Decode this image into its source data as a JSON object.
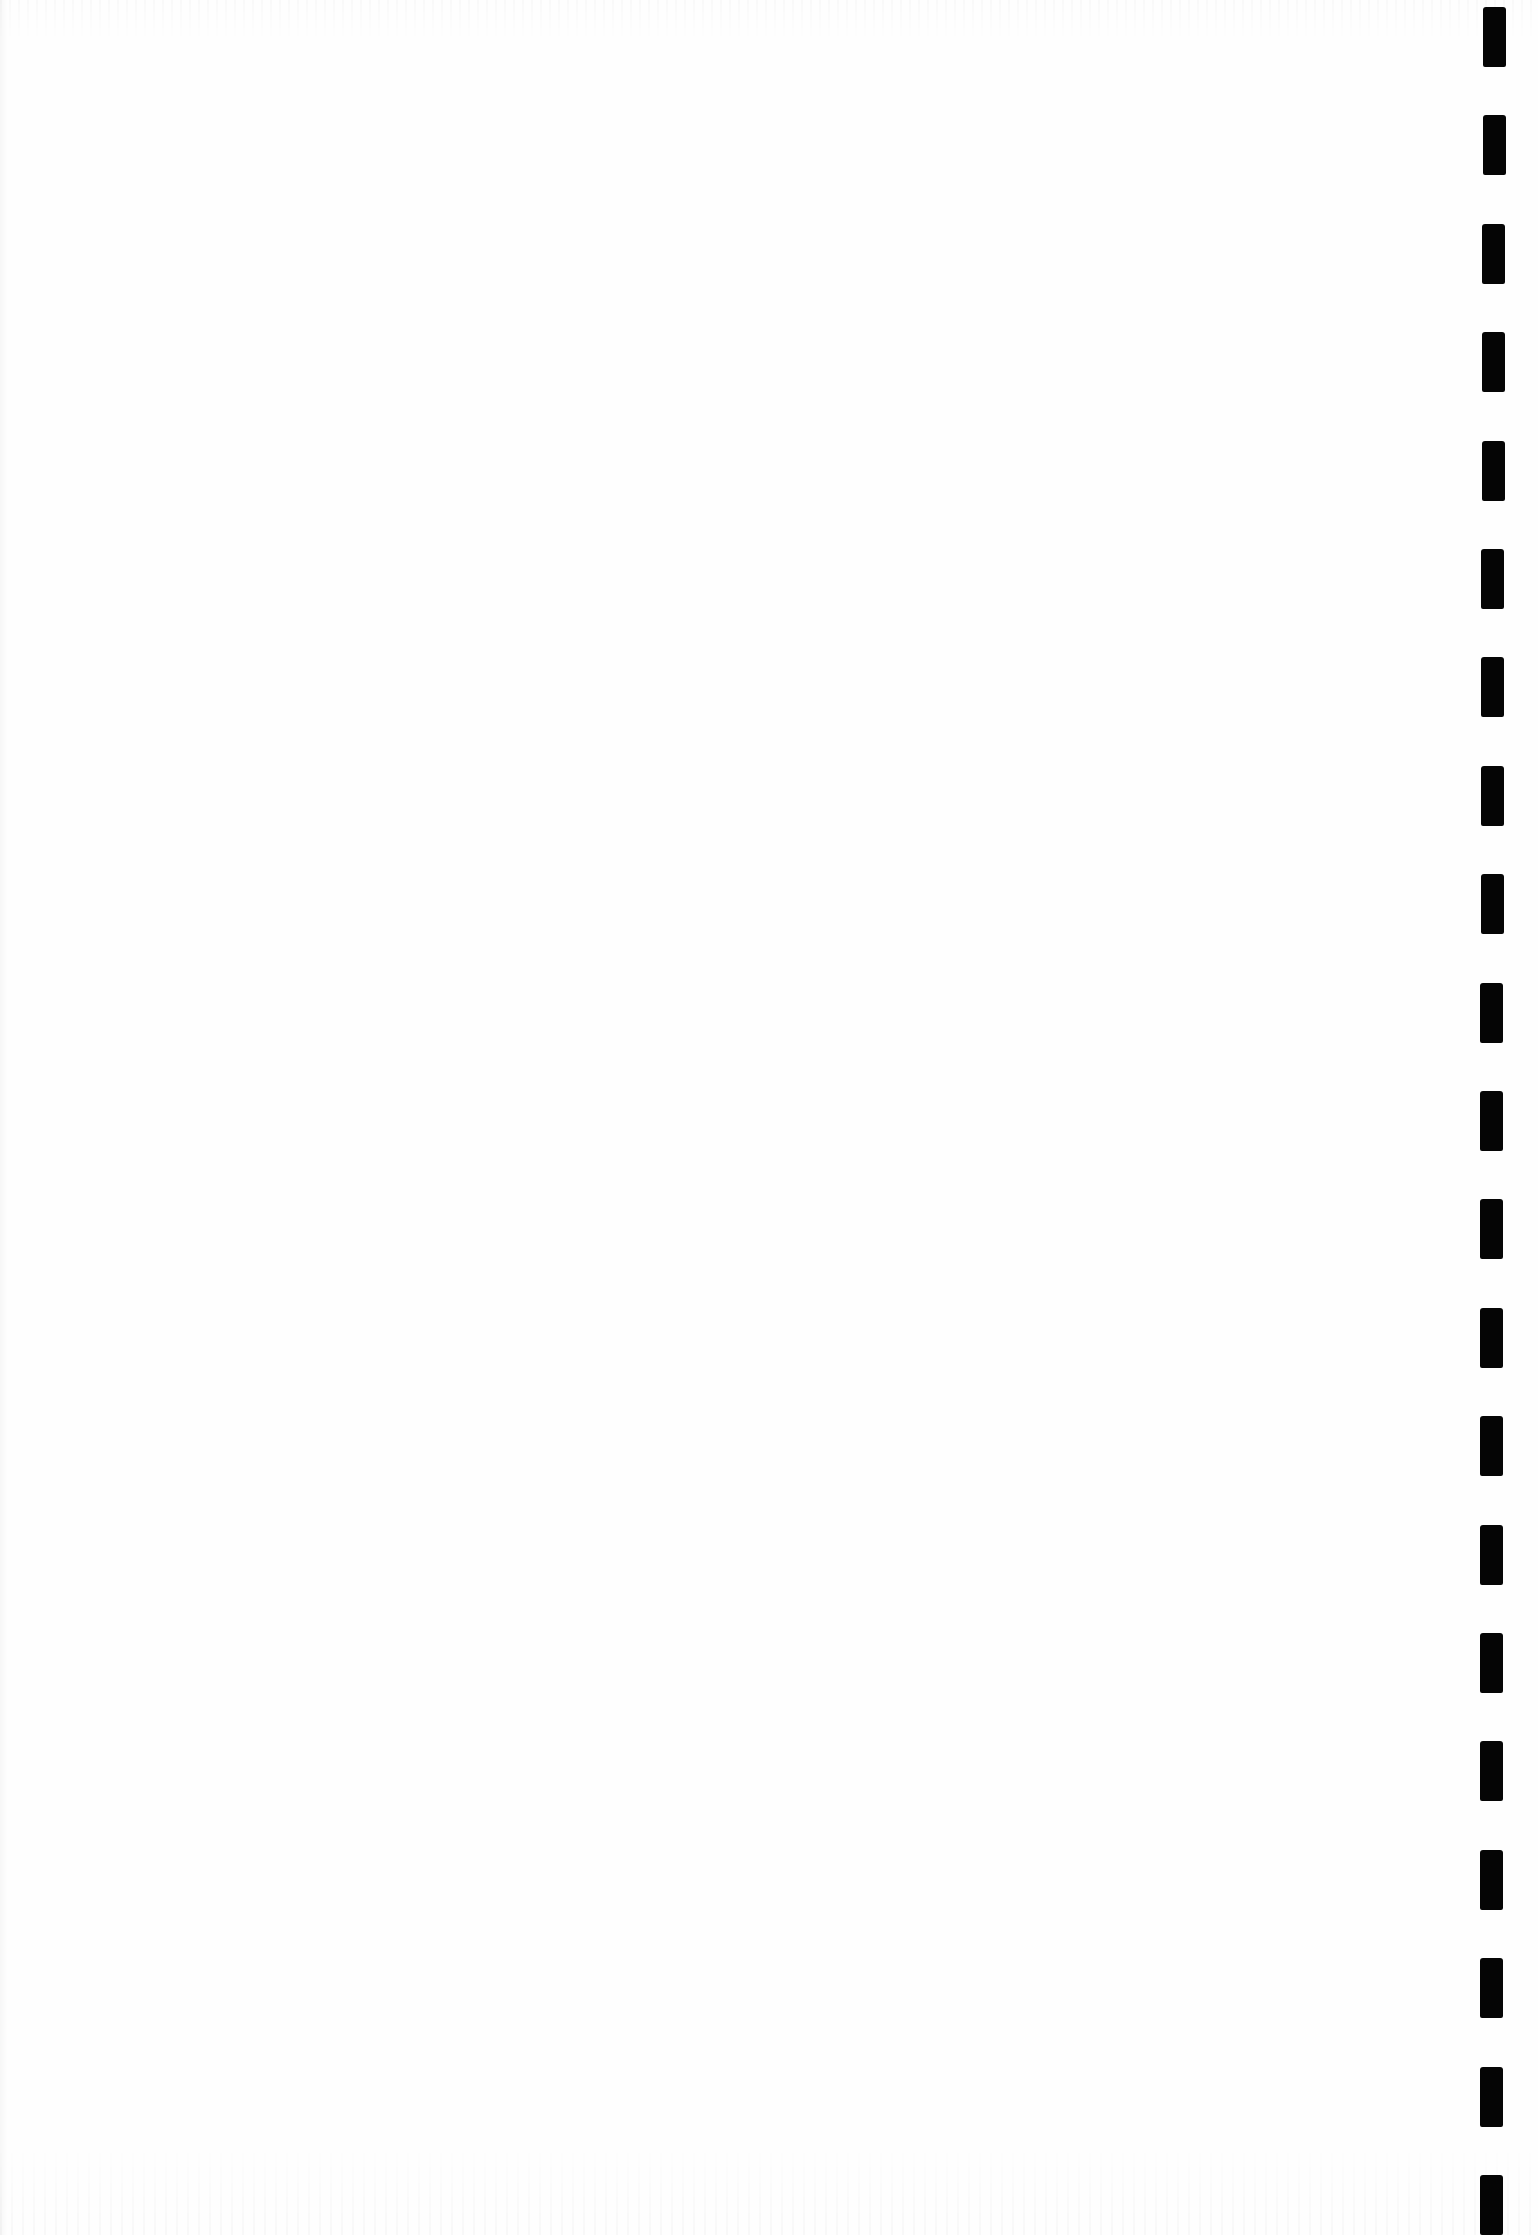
{
  "page": {
    "background": "#fefefe",
    "width": 1538,
    "height": 2235
  },
  "dashed_line": {
    "orientation": "vertical",
    "color": "#050505",
    "x": 1481,
    "dash_width": 23,
    "dash_length": 60,
    "pitch": 108.4,
    "first_dash_y": 7,
    "dash_count": 21
  }
}
